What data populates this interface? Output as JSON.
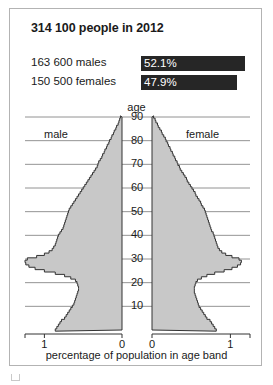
{
  "header": {
    "title": "314 100 people in 2012",
    "rows": [
      {
        "label": "163 600 males",
        "value": "52.1%",
        "pct": 52.1
      },
      {
        "label": "150 500 females",
        "value": "47.9%",
        "pct": 47.9
      }
    ]
  },
  "labels": {
    "age": "age",
    "male": "male",
    "female": "female",
    "xtitle": "percentage of population in age band"
  },
  "chart_data": {
    "type": "bar",
    "orientation": "horizontal",
    "subtype": "population-pyramid",
    "title": "314 100 people in 2012",
    "xlabel": "percentage of population in age band",
    "ylabel": "age",
    "grid": true,
    "legend_position": "in-plot",
    "legend": [
      "male",
      "female"
    ],
    "ylim": [
      0,
      90
    ],
    "yticks": [
      10,
      20,
      30,
      40,
      50,
      60,
      70,
      80,
      90
    ],
    "xlim_left": [
      1.25,
      0
    ],
    "xlim_right": [
      0,
      1.25
    ],
    "xticks_left": [
      "1",
      "0"
    ],
    "xticks_right": [
      "0",
      "1"
    ],
    "ages": [
      0,
      1,
      2,
      3,
      4,
      5,
      6,
      7,
      8,
      9,
      10,
      11,
      12,
      13,
      14,
      15,
      16,
      17,
      18,
      19,
      20,
      21,
      22,
      23,
      24,
      25,
      26,
      27,
      28,
      29,
      30,
      31,
      32,
      33,
      34,
      35,
      36,
      37,
      38,
      39,
      40,
      41,
      42,
      43,
      44,
      45,
      46,
      47,
      48,
      49,
      50,
      51,
      52,
      53,
      54,
      55,
      56,
      57,
      58,
      59,
      60,
      61,
      62,
      63,
      64,
      65,
      66,
      67,
      68,
      69,
      70,
      71,
      72,
      73,
      74,
      75,
      76,
      77,
      78,
      79,
      80,
      81,
      82,
      83,
      84,
      85,
      86,
      87,
      88,
      89,
      90
    ],
    "series": [
      {
        "name": "male",
        "side": "left",
        "values": [
          0.86,
          0.84,
          0.82,
          0.8,
          0.78,
          0.74,
          0.72,
          0.7,
          0.68,
          0.66,
          0.64,
          0.62,
          0.61,
          0.6,
          0.59,
          0.58,
          0.57,
          0.56,
          0.56,
          0.57,
          0.58,
          0.6,
          0.66,
          0.74,
          0.86,
          1.0,
          1.12,
          1.2,
          1.24,
          1.25,
          1.22,
          1.1,
          1.0,
          0.94,
          0.9,
          0.88,
          0.86,
          0.85,
          0.84,
          0.83,
          0.82,
          0.8,
          0.78,
          0.76,
          0.75,
          0.74,
          0.73,
          0.72,
          0.71,
          0.7,
          0.69,
          0.68,
          0.66,
          0.64,
          0.62,
          0.6,
          0.58,
          0.56,
          0.54,
          0.52,
          0.5,
          0.48,
          0.46,
          0.44,
          0.42,
          0.4,
          0.38,
          0.36,
          0.34,
          0.32,
          0.31,
          0.3,
          0.28,
          0.26,
          0.25,
          0.23,
          0.22,
          0.2,
          0.19,
          0.17,
          0.16,
          0.14,
          0.13,
          0.11,
          0.1,
          0.08,
          0.07,
          0.05,
          0.04,
          0.03,
          0.02
        ]
      },
      {
        "name": "female",
        "side": "right",
        "values": [
          0.82,
          0.8,
          0.78,
          0.76,
          0.74,
          0.7,
          0.68,
          0.66,
          0.64,
          0.62,
          0.6,
          0.59,
          0.58,
          0.57,
          0.56,
          0.55,
          0.54,
          0.54,
          0.54,
          0.55,
          0.56,
          0.58,
          0.63,
          0.7,
          0.8,
          0.92,
          1.02,
          1.09,
          1.13,
          1.14,
          1.11,
          1.02,
          0.94,
          0.89,
          0.86,
          0.84,
          0.83,
          0.82,
          0.81,
          0.8,
          0.79,
          0.78,
          0.76,
          0.75,
          0.74,
          0.73,
          0.72,
          0.71,
          0.7,
          0.69,
          0.68,
          0.67,
          0.65,
          0.63,
          0.62,
          0.6,
          0.58,
          0.56,
          0.55,
          0.53,
          0.51,
          0.49,
          0.47,
          0.45,
          0.44,
          0.42,
          0.4,
          0.38,
          0.36,
          0.35,
          0.33,
          0.32,
          0.3,
          0.29,
          0.27,
          0.26,
          0.24,
          0.23,
          0.21,
          0.2,
          0.18,
          0.17,
          0.15,
          0.13,
          0.12,
          0.1,
          0.08,
          0.07,
          0.05,
          0.04,
          0.02
        ]
      }
    ]
  }
}
